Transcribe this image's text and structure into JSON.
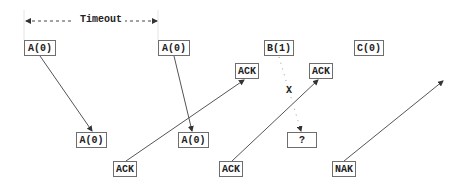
{
  "diagram": {
    "timeout_label": "Timeout",
    "lost_marker": "X",
    "boxes": [
      {
        "id": "send-a0-1",
        "label": "A(0)",
        "x": 24,
        "y": 40,
        "w": 32
      },
      {
        "id": "send-a0-2",
        "label": "A(0)",
        "x": 158,
        "y": 40,
        "w": 32
      },
      {
        "id": "send-b1",
        "label": "B(1)",
        "x": 264,
        "y": 40,
        "w": 30
      },
      {
        "id": "send-c0",
        "label": "C(0)",
        "x": 354,
        "y": 40,
        "w": 30
      },
      {
        "id": "recv-ack-1",
        "label": "ACK",
        "x": 235,
        "y": 63,
        "w": 24
      },
      {
        "id": "recv-ack-2",
        "label": "ACK",
        "x": 309,
        "y": 63,
        "w": 24
      },
      {
        "id": "recv-a0-1",
        "label": "A(0)",
        "x": 76,
        "y": 132,
        "w": 31
      },
      {
        "id": "recv-a0-2",
        "label": "A(0)",
        "x": 178,
        "y": 132,
        "w": 31
      },
      {
        "id": "recv-unknown",
        "label": "?",
        "x": 287,
        "y": 132,
        "w": 30
      },
      {
        "id": "send-ack-1",
        "label": "ACK",
        "x": 113,
        "y": 161,
        "w": 24
      },
      {
        "id": "send-ack-2",
        "label": "ACK",
        "x": 219,
        "y": 161,
        "w": 24
      },
      {
        "id": "send-nak",
        "label": "NAK",
        "x": 332,
        "y": 161,
        "w": 24
      }
    ]
  }
}
